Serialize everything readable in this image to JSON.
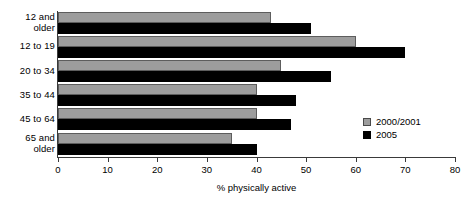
{
  "chart_data": {
    "type": "bar",
    "orientation": "horizontal",
    "title": "",
    "xlabel": "% physically active",
    "ylabel": "",
    "xlim": [
      0,
      80
    ],
    "xticks": [
      0,
      10,
      20,
      30,
      40,
      50,
      60,
      70,
      80
    ],
    "grid": false,
    "legend_position": "center-right",
    "categories": [
      "12 and\nolder",
      "12 to 19",
      "20 to 34",
      "35 to 44",
      "45 to 64",
      "65 and\nolder"
    ],
    "series": [
      {
        "name": "2000/2001",
        "color": "#9d9d9d",
        "values": [
          43,
          60,
          45,
          40,
          40,
          35
        ]
      },
      {
        "name": "2005",
        "color": "#000000",
        "values": [
          51,
          70,
          55,
          48,
          47,
          40
        ]
      }
    ]
  },
  "legend": {
    "items": [
      {
        "label": "2000/2001"
      },
      {
        "label": "2005"
      }
    ]
  }
}
